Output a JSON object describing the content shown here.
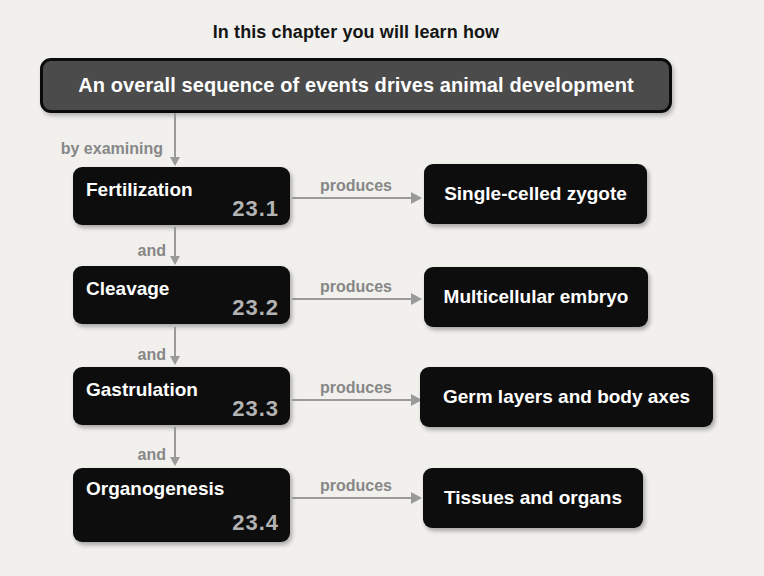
{
  "title": "In this chapter you will learn how",
  "overview": {
    "label": "An overall sequence of events drives animal development"
  },
  "labels": {
    "by_examining": "by examining",
    "and": "and",
    "produces": "produces"
  },
  "rows": [
    {
      "stage": "Fertilization",
      "section": "23.1",
      "result": "Single-celled zygote"
    },
    {
      "stage": "Cleavage",
      "section": "23.2",
      "result": "Multicellular embryo"
    },
    {
      "stage": "Gastrulation",
      "section": "23.3",
      "result": "Germ layers and body axes"
    },
    {
      "stage": "Organogenesis",
      "section": "23.4",
      "result": "Tissues and organs"
    }
  ],
  "colors": {
    "background": "#f1f0ed",
    "box_black": "#0d0d0d",
    "box_gray": "#4b4b4b",
    "label_gray": "#878787",
    "section_number": "#b3b3b3",
    "arrow": "#9a9a9a",
    "text_white": "#ffffff",
    "title_black": "#151515"
  }
}
